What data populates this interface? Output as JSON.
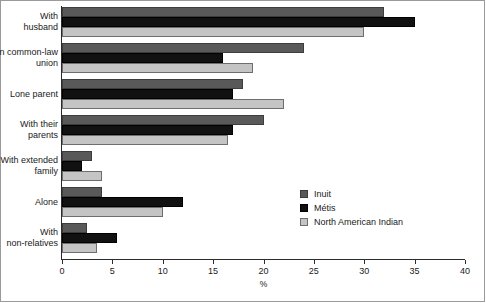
{
  "chart_data": {
    "type": "bar",
    "orientation": "horizontal",
    "title": "",
    "xlabel": "%",
    "ylabel": "",
    "xlim": [
      0,
      40
    ],
    "xticks": [
      0,
      5,
      10,
      15,
      20,
      25,
      30,
      35,
      40
    ],
    "grid": false,
    "legend_position": "middle-right",
    "categories": [
      "With husband",
      "In common-law union",
      "Lone parent",
      "With their parents",
      "With extended family",
      "Alone",
      "With non-relatives"
    ],
    "category_lines": [
      [
        "With",
        "husband"
      ],
      [
        "In common-law",
        "union"
      ],
      [
        "Lone parent"
      ],
      [
        "With their",
        "parents"
      ],
      [
        "With extended",
        "family"
      ],
      [
        "Alone"
      ],
      [
        "With",
        "non-relatives"
      ]
    ],
    "series": [
      {
        "name": "Inuit",
        "color": "#595959",
        "values": [
          32,
          24,
          18,
          20,
          3,
          4,
          2.5
        ]
      },
      {
        "name": "Métis",
        "color": "#111111",
        "values": [
          35,
          16,
          17,
          17,
          2,
          12,
          5.5
        ]
      },
      {
        "name": "North American Indian",
        "color": "#c4c4c4",
        "values": [
          30,
          19,
          22,
          16.5,
          4,
          10,
          3.5
        ]
      }
    ]
  },
  "axis": {
    "x_tick_labels": [
      "0",
      "5",
      "10",
      "15",
      "20",
      "25",
      "30",
      "35",
      "40"
    ],
    "x_title": "%"
  },
  "legend": {
    "items": [
      {
        "label": "Inuit",
        "swatch": "dark-gray"
      },
      {
        "label": "Métis",
        "swatch": "black"
      },
      {
        "label": "North American Indian",
        "swatch": "light-gray"
      }
    ]
  }
}
